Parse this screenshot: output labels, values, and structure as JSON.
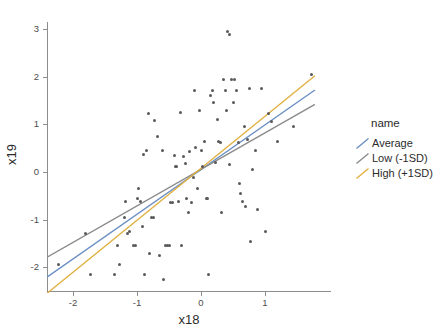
{
  "chart_data": {
    "type": "scatter",
    "title": "",
    "xlabel": "x18",
    "ylabel": "x19",
    "xlim": [
      -2.45,
      1.95
    ],
    "ylim": [
      -2.55,
      3.25
    ],
    "xticks": [
      -2,
      -1,
      0,
      1
    ],
    "xtick_labels": [
      "-2",
      "-1",
      "0",
      "1"
    ],
    "yticks": [
      3,
      2,
      1,
      0,
      -1,
      -2
    ],
    "ytick_labels": [
      "3",
      "2",
      "1",
      "0",
      "-1",
      "-2"
    ],
    "grid": false,
    "legend_position": "right",
    "legend_title": "name",
    "point_color": "#595959",
    "series": [
      {
        "name": "Average",
        "type": "line",
        "color": "#6b8ec4",
        "x": [
          -2.42,
          1.78
        ],
        "y": [
          -2.22,
          1.72
        ],
        "slope": 0.938,
        "intercept": 0.048
      },
      {
        "name": "Low (-1SD)",
        "type": "line",
        "color": "#8a8a8a",
        "x": [
          -2.42,
          1.78
        ],
        "y": [
          -1.8,
          1.42
        ],
        "slope": 0.767,
        "intercept": 0.056
      },
      {
        "name": "High (+1SD)",
        "type": "line",
        "color": "#e0b040",
        "x": [
          -2.42,
          1.78
        ],
        "y": [
          -2.56,
          2.02
        ],
        "slope": 1.09,
        "intercept": 0.083
      }
    ],
    "points": [
      [
        -2.22,
        -1.95
      ],
      [
        -1.8,
        -1.28
      ],
      [
        -1.72,
        -2.15
      ],
      [
        -1.35,
        -2.15
      ],
      [
        -1.3,
        -1.55
      ],
      [
        -1.28,
        -1.95
      ],
      [
        -1.2,
        -0.95
      ],
      [
        -1.18,
        -0.62
      ],
      [
        -1.15,
        -1.28
      ],
      [
        -1.12,
        -1.25
      ],
      [
        -1.05,
        -1.55
      ],
      [
        -1.02,
        -1.55
      ],
      [
        -1.0,
        -0.55
      ],
      [
        -0.98,
        -0.35
      ],
      [
        -0.95,
        -0.62
      ],
      [
        -0.92,
        -1.15
      ],
      [
        -0.9,
        0.37
      ],
      [
        -0.88,
        -2.15
      ],
      [
        -0.85,
        0.45
      ],
      [
        -0.82,
        1.22
      ],
      [
        -0.8,
        -1.72
      ],
      [
        -0.78,
        -0.95
      ],
      [
        -0.75,
        -0.95
      ],
      [
        -0.72,
        1.08
      ],
      [
        -0.68,
        0.75
      ],
      [
        -0.65,
        -1.75
      ],
      [
        -0.6,
        0.45
      ],
      [
        -0.58,
        -2.25
      ],
      [
        -0.55,
        -1.55
      ],
      [
        -0.52,
        -1.55
      ],
      [
        -0.5,
        -1.55
      ],
      [
        -0.48,
        -0.65
      ],
      [
        -0.45,
        -0.65
      ],
      [
        -0.42,
        0.35
      ],
      [
        -0.4,
        0.12
      ],
      [
        -0.38,
        0.12
      ],
      [
        -0.35,
        -0.62
      ],
      [
        -0.32,
        1.25
      ],
      [
        -0.3,
        -1.55
      ],
      [
        -0.28,
        0.32
      ],
      [
        -0.25,
        0.18
      ],
      [
        -0.22,
        -0.55
      ],
      [
        -0.2,
        -0.85
      ],
      [
        -0.18,
        0.42
      ],
      [
        -0.15,
        -0.65
      ],
      [
        -0.12,
        -0.12
      ],
      [
        -0.1,
        1.72
      ],
      [
        -0.08,
        0.52
      ],
      [
        -0.05,
        -0.35
      ],
      [
        -0.02,
        1.3
      ],
      [
        0.0,
        0.45
      ],
      [
        0.02,
        0.12
      ],
      [
        0.05,
        0.65
      ],
      [
        0.08,
        -0.55
      ],
      [
        0.1,
        -0.55
      ],
      [
        0.12,
        -2.15
      ],
      [
        0.15,
        1.6
      ],
      [
        0.18,
        1.72
      ],
      [
        0.2,
        1.45
      ],
      [
        0.22,
        0.2
      ],
      [
        0.25,
        1.1
      ],
      [
        0.28,
        0.65
      ],
      [
        0.3,
        0.62
      ],
      [
        0.32,
        -0.85
      ],
      [
        0.35,
        1.95
      ],
      [
        0.38,
        1.72
      ],
      [
        0.4,
        1.3
      ],
      [
        0.42,
        2.95
      ],
      [
        0.44,
        2.88
      ],
      [
        0.45,
        0.15
      ],
      [
        0.48,
        1.95
      ],
      [
        0.5,
        1.45
      ],
      [
        0.52,
        1.95
      ],
      [
        0.55,
        1.72
      ],
      [
        0.58,
        0.62
      ],
      [
        0.6,
        -0.25
      ],
      [
        0.62,
        -0.45
      ],
      [
        0.65,
        -0.62
      ],
      [
        0.68,
        0.95
      ],
      [
        0.7,
        -0.72
      ],
      [
        0.72,
        0.68
      ],
      [
        0.75,
        1.75
      ],
      [
        0.78,
        -1.45
      ],
      [
        0.8,
        0.05
      ],
      [
        0.85,
        0.45
      ],
      [
        0.88,
        -0.78
      ],
      [
        0.95,
        1.75
      ],
      [
        1.0,
        -1.25
      ],
      [
        1.05,
        1.22
      ],
      [
        1.1,
        1.05
      ],
      [
        1.2,
        0.65
      ],
      [
        1.45,
        0.95
      ],
      [
        1.72,
        2.05
      ]
    ]
  },
  "axes": {
    "x_title": "x18",
    "y_title": "x19"
  },
  "legend": {
    "title": "name",
    "items": [
      {
        "label": "Average",
        "color": "#6b8ec4"
      },
      {
        "label": "Low (-1SD)",
        "color": "#8a8a8a"
      },
      {
        "label": "High (+1SD)",
        "color": "#e0b040"
      }
    ]
  }
}
